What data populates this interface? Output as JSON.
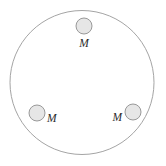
{
  "figure": {
    "type": "physics-diagram",
    "background_color": "#ffffff",
    "canvas": {
      "width": 166,
      "height": 166
    },
    "ring": {
      "name": "large-circle",
      "cx": 82,
      "cy": 82.5,
      "r": 72,
      "stroke_color": "#9a9a9a",
      "stroke_width": 0.9,
      "fill": "none"
    },
    "mass_style": {
      "fill_color": "#e6e6e6",
      "stroke_color": "#8f8f8f",
      "stroke_width": 0.9,
      "radius": 8
    },
    "masses": [
      {
        "id": "mass-top",
        "position": "top",
        "cx": 84,
        "cy": 26,
        "label": "M",
        "label_x": 84,
        "label_y": 47,
        "label_anchor": "middle"
      },
      {
        "id": "mass-bottom-left",
        "position": "bottom-left",
        "cx": 37,
        "cy": 113,
        "label": "M",
        "label_x": 47,
        "label_y": 122,
        "label_anchor": "start"
      },
      {
        "id": "mass-bottom-right",
        "position": "bottom-right",
        "cx": 133,
        "cy": 112,
        "label": "M",
        "label_x": 122,
        "label_y": 121,
        "label_anchor": "end"
      }
    ]
  }
}
